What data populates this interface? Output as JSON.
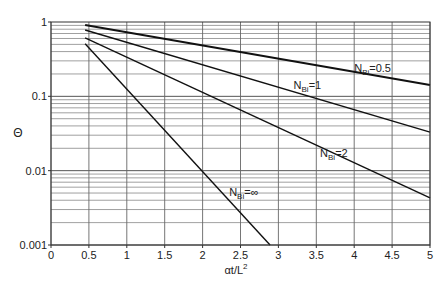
{
  "chart_data": {
    "type": "line",
    "title": "",
    "xlabel": "αt/L²",
    "ylabel": "Θ",
    "xlim": [
      0,
      5
    ],
    "ylim": [
      0.001,
      1
    ],
    "yscale": "log",
    "grid": true,
    "x_ticks": [
      "0",
      "0.5",
      "1",
      "1.5",
      "2",
      "2.5",
      "3",
      "3.5",
      "4",
      "4.5",
      "5"
    ],
    "y_ticks": [
      "0.001",
      "0.01",
      "0.1",
      "1"
    ],
    "series": [
      {
        "name": "N_Bi=0.5",
        "label_main": "N",
        "label_sub": "Bi",
        "label_rest": "=0.5",
        "x": [
          0.45,
          5.0
        ],
        "y": [
          0.91,
          0.142
        ],
        "stroke_width": 2
      },
      {
        "name": "N_Bi=1",
        "label_main": "N",
        "label_sub": "Bi",
        "label_rest": "=1",
        "x": [
          0.45,
          5.0
        ],
        "y": [
          0.78,
          0.033
        ],
        "stroke_width": 1.4
      },
      {
        "name": "N_Bi=2",
        "label_main": "N",
        "label_sub": "Bi",
        "label_rest": "=2",
        "x": [
          0.45,
          5.0
        ],
        "y": [
          0.61,
          0.0043
        ],
        "stroke_width": 1.4
      },
      {
        "name": "N_Bi=∞",
        "label_main": "N",
        "label_sub": "Bi",
        "label_rest": "=∞",
        "x": [
          0.45,
          2.89
        ],
        "y": [
          0.51,
          0.001
        ],
        "stroke_width": 1.4
      }
    ],
    "annotations": [
      {
        "series": "N_Bi=0.5",
        "x": 4.0,
        "y": 0.21
      },
      {
        "series": "N_Bi=1",
        "x": 3.2,
        "y": 0.125
      },
      {
        "series": "N_Bi=2",
        "x": 3.55,
        "y": 0.0155
      },
      {
        "series": "N_Bi=∞",
        "x": 2.35,
        "y": 0.0045
      }
    ],
    "legend": "none (inline labels)"
  },
  "axes": {
    "x_label_main": "αt/L",
    "x_label_sup": "2",
    "y_label": "Θ"
  }
}
